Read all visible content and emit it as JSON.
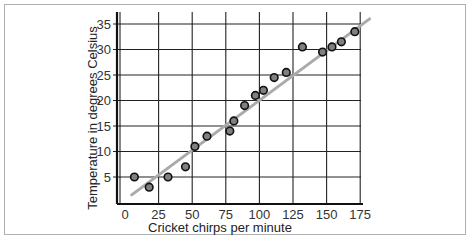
{
  "chart_data": {
    "type": "scatter",
    "title": "",
    "xlabel": "Cricket chirps per minute",
    "ylabel": "Temperature in degrees Celsius",
    "xlim": [
      0,
      190
    ],
    "ylim": [
      0,
      37
    ],
    "x_ticks": [
      0,
      25,
      50,
      75,
      100,
      125,
      150,
      175
    ],
    "y_ticks": [
      5,
      10,
      15,
      20,
      25,
      30,
      35
    ],
    "grid": true,
    "legend": null,
    "series": [
      {
        "name": "observations",
        "marker": "circle",
        "color": "#808080",
        "points": [
          {
            "x": 7,
            "y": 5
          },
          {
            "x": 18,
            "y": 3
          },
          {
            "x": 32,
            "y": 5
          },
          {
            "x": 45,
            "y": 7
          },
          {
            "x": 52,
            "y": 11
          },
          {
            "x": 61,
            "y": 13
          },
          {
            "x": 78,
            "y": 14
          },
          {
            "x": 81,
            "y": 16
          },
          {
            "x": 89,
            "y": 19
          },
          {
            "x": 97,
            "y": 21
          },
          {
            "x": 103,
            "y": 22
          },
          {
            "x": 111,
            "y": 24.5
          },
          {
            "x": 120,
            "y": 25.5
          },
          {
            "x": 132,
            "y": 30.5
          },
          {
            "x": 147,
            "y": 29.5
          },
          {
            "x": 154,
            "y": 30.5
          },
          {
            "x": 161,
            "y": 31.5
          },
          {
            "x": 171,
            "y": 33.5
          }
        ]
      },
      {
        "name": "trend line",
        "type": "line",
        "color": "#aaaaaa",
        "points": [
          {
            "x": 5,
            "y": 1.5
          },
          {
            "x": 182,
            "y": 36
          }
        ]
      }
    ]
  }
}
